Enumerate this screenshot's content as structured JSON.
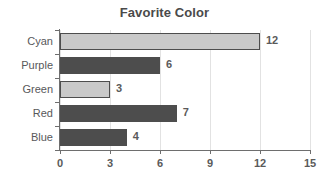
{
  "chart_data": {
    "type": "bar",
    "orientation": "horizontal",
    "title": "Favorite Color",
    "xlabel": "",
    "ylabel": "",
    "categories": [
      "Cyan",
      "Purple",
      "Green",
      "Red",
      "Blue"
    ],
    "values": [
      12,
      6,
      3,
      7,
      4
    ],
    "value_labels": [
      "12",
      "6",
      "3",
      "7",
      "4"
    ],
    "bar_styles": [
      "light",
      "dark",
      "light",
      "dark",
      "dark"
    ],
    "xlim": [
      0,
      15
    ],
    "xticks": [
      0,
      3,
      6,
      9,
      12,
      15
    ],
    "xtick_labels": [
      "0",
      "3",
      "6",
      "9",
      "12",
      "15"
    ],
    "grid": true,
    "grid_axis": "x",
    "legend": false,
    "colors": {
      "bar_light": "#c9c9c9",
      "bar_dark": "#4d4d4d",
      "bar_border": "#4d4d4d",
      "gridline": "#e2e2e2",
      "axis": "#6e6e6e",
      "title_text": "#4a4a4a",
      "label_text": "#58585a",
      "value_text": "#5a5a5a",
      "background": "#ffffff"
    }
  }
}
